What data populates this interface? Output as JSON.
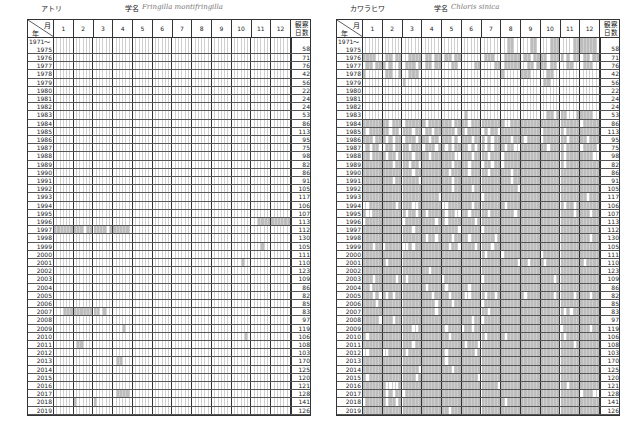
{
  "left": {
    "name_jp": "アトリ",
    "sci_label": "学名",
    "sci_name": "Fringilla montifringilla",
    "header": {
      "month_label": "月",
      "year_label": "年",
      "months": [
        "1",
        "2",
        "3",
        "4",
        "5",
        "6",
        "7",
        "8",
        "9",
        "10",
        "11",
        "12"
      ],
      "count_label_1": "観察",
      "count_label_2": "日数"
    },
    "rows": [
      {
        "year": "1971～",
        "year2": "1975",
        "count": "58",
        "cells": "000000000000000000000000000000000000000000000000000000000000000000000000"
      },
      {
        "year": "1976",
        "count": "71",
        "cells": "000000000000000000000000000000000000000000000000000000000000000000000000"
      },
      {
        "year": "1977",
        "count": "76",
        "cells": "000000000000000000000000000000000000000000000000000000000000000000000000"
      },
      {
        "year": "1978",
        "count": "42",
        "cells": "000000000000000000000000000000000000000000000000000000000000000000000000"
      },
      {
        "year": "1979",
        "count": "56",
        "cells": "000000000000000000000000000000000000000000000000000000000000000000000000"
      },
      {
        "year": "1980",
        "count": "22",
        "cells": "000000000000000000000000000000000000000000000000000000000000000000000000"
      },
      {
        "year": "1981",
        "count": "24",
        "cells": "000000000000000000000000000000000000000000000000000000000000000000000000"
      },
      {
        "year": "1982",
        "count": "24",
        "cells": "000000000000000000000000000000000000000000000000000000000000000000000000"
      },
      {
        "year": "1983",
        "count": "53",
        "cells": "000000000000000000000000000000000000000000000000000000000000000000000000"
      },
      {
        "year": "1984",
        "count": "86",
        "cells": "000000000000000000000000000000000000000000000000000000000000000000000000"
      },
      {
        "year": "1985",
        "count": "113",
        "cells": "000000000000000000000000000000000000000000000000000000000000000000000000"
      },
      {
        "year": "1986",
        "count": "95",
        "cells": "000000000000000000000000000000000000000000000000000000000000000000000000"
      },
      {
        "year": "1987",
        "count": "75",
        "cells": "000000000000000000000000000000000000000000000000000000000000000000000000"
      },
      {
        "year": "1988",
        "count": "98",
        "cells": "000000000000000000000000000000000000000000000000000000000000000000000000"
      },
      {
        "year": "1989",
        "count": "82",
        "cells": "000000000000000000000000000000000000000000000000000000000000000000000000"
      },
      {
        "year": "1990",
        "count": "86",
        "cells": "000000000000000000000000000000000000000000000000000000000000000000000000"
      },
      {
        "year": "1991",
        "count": "91",
        "cells": "000000000000000000000000000000000000000000000000000000000000000000000000"
      },
      {
        "year": "1992",
        "count": "105",
        "cells": "000000000000000000000000000000000000000000000000000000000000000000000000"
      },
      {
        "year": "1993",
        "count": "117",
        "cells": "000000000000000000000000000000000000000000000000000000000000000000000000"
      },
      {
        "year": "1994",
        "count": "106",
        "cells": "000000000000000000000000000000000000000000000000000000000000000000000000"
      },
      {
        "year": "1995",
        "count": "107",
        "cells": "000000000000000000000000000000000000000000000000000000000000000000000000"
      },
      {
        "year": "1996",
        "count": "113",
        "cells": "000000000000000000000000000000000000000000000000000000000000001111111111"
      },
      {
        "year": "1997",
        "count": "112",
        "cells": "111111111011111101111110000000000000000000000000000000000000000000000000"
      },
      {
        "year": "1998",
        "count": "130",
        "cells": "000000000000000000000000000000000000000000000000000000000000000000000000"
      },
      {
        "year": "1999",
        "count": "105",
        "cells": "000000000000000000000000000000000000000000000000000000000000000100000000"
      },
      {
        "year": "2000",
        "count": "111",
        "cells": "000000000000000000000000000000000000000000000000000000000000000000000000"
      },
      {
        "year": "2001",
        "count": "110",
        "cells": "000000000000000000000000000000000000000000000000000000000100000000000000"
      },
      {
        "year": "2002",
        "count": "123",
        "cells": "000000000000000000000000000000000000000000000000000000000000000000000000"
      },
      {
        "year": "2003",
        "count": "109",
        "cells": "000000000000000000000000000000000000000000000000000000000000000000000000"
      },
      {
        "year": "2004",
        "count": "86",
        "cells": "000000000000000000000000000000000000000000000000000000000000000000000000"
      },
      {
        "year": "2005",
        "count": "82",
        "cells": "000000000000000000000000000000000000000000000000000000000000000000000000"
      },
      {
        "year": "2006",
        "count": "85",
        "cells": "000000000000000000000000000000000000000000000000000000000000000000000000"
      },
      {
        "year": "2007",
        "count": "83",
        "cells": "000111111111110100000000000000000000000000000000000000000000000000000000"
      },
      {
        "year": "2008",
        "count": "97",
        "cells": "000000000000000000000000000000000000000000000000000000000000000000000000"
      },
      {
        "year": "2009",
        "count": "119",
        "cells": "000000000000000000000100000000000000000000000000000000000000000000000000"
      },
      {
        "year": "2010",
        "count": "106",
        "cells": "000000000000000000000000000000000000000000000000000000000010000000000000"
      },
      {
        "year": "2011",
        "count": "108",
        "cells": "000000011000000000000000000000000000000000000000000000000000000000000000"
      },
      {
        "year": "2012",
        "count": "103",
        "cells": "000000000000000000000000000000000000000000000000000000000000000000000000"
      },
      {
        "year": "2013",
        "count": "170",
        "cells": "000000000000000000011000000000000000000000000000000000000000000000000000"
      },
      {
        "year": "2014",
        "count": "125",
        "cells": "000000000000000000000000000000000000000000000000000000000000000000000000"
      },
      {
        "year": "2015",
        "count": "120",
        "cells": "000000000000000000000000000000000000000000000000000000000000000000000000"
      },
      {
        "year": "2016",
        "count": "121",
        "cells": "000000000000000000000000000000000000000000000000000000000000000000000000"
      },
      {
        "year": "2017",
        "count": "128",
        "cells": "000000000000000000011110000000000000000000000000000000000000000000000000"
      },
      {
        "year": "2018",
        "count": "141",
        "cells": "000000100000100000000000000000000000000000000000000000000000000000000000"
      },
      {
        "year": "2019",
        "count": "126",
        "cells": "000000000000000000000000000000000000000000000000000000000000000000000000"
      }
    ]
  },
  "right": {
    "name_jp": "カワラヒワ",
    "sci_label": "学名",
    "sci_name": "Chloris sinica",
    "header": {
      "month_label": "月",
      "year_label": "年",
      "months": [
        "1",
        "2",
        "3",
        "4",
        "5",
        "6",
        "7",
        "8",
        "9",
        "10",
        "11",
        "12"
      ],
      "count_label_1": "観察",
      "count_label_2": "日数"
    },
    "rows": [
      {
        "year": "1971～",
        "year2": "1975",
        "count": "58",
        "cells": "000000000000000000000000000000000000000000001100000110000111000011111110"
      },
      {
        "year": "1976",
        "count": "71",
        "cells": "111100011011001111011011011011000000011100011111011011110111101011011011"
      },
      {
        "year": "1977",
        "count": "76",
        "cells": "011011101001011101011011000110000011000011011111001101110110001100011100"
      },
      {
        "year": "1978",
        "count": "42",
        "cells": "100000011001001110000000000000000000000000100000111000001100000000000000"
      },
      {
        "year": "1979",
        "count": "56",
        "cells": "000000000000100000000000000000000000000000000000000000011000000000000000"
      },
      {
        "year": "1980",
        "count": "22",
        "cells": "000000000000000000000000000000000000000000000000000000000000000000000000"
      },
      {
        "year": "1981",
        "count": "24",
        "cells": "000000000000000000000000000000000000000000000000000000000000000000000000"
      },
      {
        "year": "1982",
        "count": "24",
        "cells": "000000000000000000000000000000000000000000000000000000000000000000000000"
      },
      {
        "year": "1983",
        "count": "53",
        "cells": "000000000000000000000000000000010000000000000000000000001101110001111100"
      },
      {
        "year": "1984",
        "count": "86",
        "cells": "111111110111011111101111111011110111111111100111111111111111111111011111"
      },
      {
        "year": "1985",
        "count": "113",
        "cells": "101111110110111011011011111101101111010110111111111111011111101111111111"
      },
      {
        "year": "1986",
        "count": "95",
        "cells": "111011101011011101110110111010111011101011111011101111011111110111110111"
      },
      {
        "year": "1987",
        "count": "75",
        "cells": "010110011011110111011101101011110101101011101100111111110111101111011110"
      },
      {
        "year": "1988",
        "count": "98",
        "cells": "110111101101111011110111111100111011110111011111111111111111101111111100"
      },
      {
        "year": "1989",
        "count": "82",
        "cells": "111111111011110110111111111011110111011011011111111111111111101111111111"
      },
      {
        "year": "1990",
        "count": "86",
        "cells": "111111111111111011111111110111110111110111111011111111111111111111111111"
      },
      {
        "year": "1991",
        "count": "91",
        "cells": "111111111011111110111111111011111111111111111011111111111111111111111111"
      },
      {
        "year": "1992",
        "count": "105",
        "cells": "111111111111111111111111111011111011111111111110111111111111111111111111"
      },
      {
        "year": "1993",
        "count": "117",
        "cells": "111111111111111111111110111111111111011111111111111111111111111111110111"
      },
      {
        "year": "1994",
        "count": "106",
        "cells": "001111111101111001111111001111111011111111101111111111111111101101111111"
      },
      {
        "year": "1995",
        "count": "107",
        "cells": "100111111111101101101111101100110111110111111101111111111111111101111011"
      },
      {
        "year": "1996",
        "count": "113",
        "cells": "011111111111011111111101101111111101111111111111111111111111111111111111"
      },
      {
        "year": "1997",
        "count": "112",
        "cells": "111111111111111011111111111110111111011111111111111111111111111111111111"
      },
      {
        "year": "1998",
        "count": "130",
        "cells": "111111111111111111101101111011110111111101111111111111111111111111111011"
      },
      {
        "year": "1999",
        "count": "105",
        "cells": "111011011111001011111111110110111101111011111111111111111111111111111111"
      },
      {
        "year": "2000",
        "count": "111",
        "cells": "111111111111111111111111111111111111101111011111111111011111111111111111"
      },
      {
        "year": "2001",
        "count": "110",
        "cells": "111111101111111111111111111111111111111111111110110111101111111111101111"
      },
      {
        "year": "2002",
        "count": "123",
        "cells": "111111111111111111110111111111111111111111111111111111111111111111111111"
      },
      {
        "year": "2003",
        "count": "109",
        "cells": "111011111101101111111111011111111111011111111111111111111101111111111111"
      },
      {
        "year": "2004",
        "count": "86",
        "cells": "110111111111111111101111101111110111111111111111111111111111111111111111"
      },
      {
        "year": "2005",
        "count": "82",
        "cells": "111010101011111111111011110111100111101101111111101111111101111101111011"
      },
      {
        "year": "2006",
        "count": "85",
        "cells": "111101111111111111111101111011111111011111111111111111111111111111111111"
      },
      {
        "year": "2007",
        "count": "83",
        "cells": "111111111111111111111101111111111111110111111111111111111111101011111111"
      },
      {
        "year": "2008",
        "count": "97",
        "cells": "111110111011111111111111111111111011011111111111111111111111111111111111"
      },
      {
        "year": "2009",
        "count": "119",
        "cells": "111111111111111001111111101111011011111111111111111111111111011111111011"
      },
      {
        "year": "2010",
        "count": "106",
        "cells": "101111111111111111111111110111111111101111101111111111111111101111111111"
      },
      {
        "year": "2011",
        "count": "108",
        "cells": "111111111111111011111111111111101110111111111111111111111111111101111111"
      },
      {
        "year": "2012",
        "count": "103",
        "cells": "001111001111101111111111101111111101111111111111111111111111111111111111"
      },
      {
        "year": "2013",
        "count": "170",
        "cells": "111111111111111111111111101111111111111111111111111111111111111111111111"
      },
      {
        "year": "2014",
        "count": "125",
        "cells": "111111111111111110111111111011111111111111111111111111111111111111111111"
      },
      {
        "year": "2015",
        "count": "120",
        "cells": "101111111111111101111111111111111110111111111111111111111111111111111111"
      },
      {
        "year": "2016",
        "count": "121",
        "cells": "111111100001111111111111111111111111111110111111111111111111110111111111"
      },
      {
        "year": "2017",
        "count": "128",
        "cells": "111111101011011111111111111111111111111111111111111111111111111111011100"
      },
      {
        "year": "2018",
        "count": "141",
        "cells": "011111101101111111111111111111111111111111101111111111111111111111111111"
      },
      {
        "year": "2019",
        "count": "126",
        "cells": "111111111111111111111111110111111111111111111111111111111111111111111111"
      }
    ]
  }
}
